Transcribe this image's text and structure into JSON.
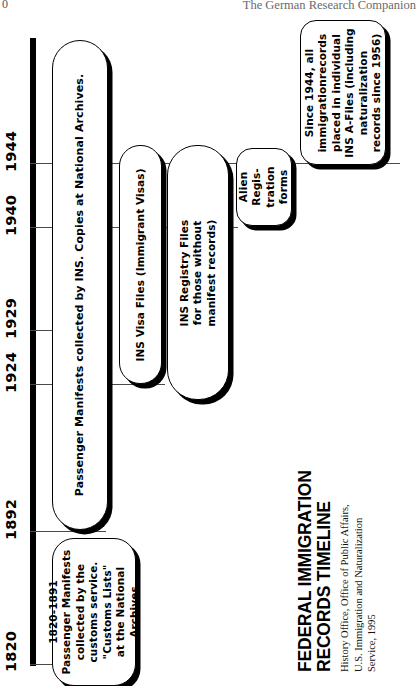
{
  "page": {
    "folio": "0",
    "running_head": "The German Research Companion"
  },
  "title_block": {
    "line1": "FEDERAL IMMIGRATION",
    "line2": "RECORDS TIMELINE",
    "credit_line1": "History Office, Office of  Public Affairs,",
    "credit_line2": "U.S. Immigration and Naturalization",
    "credit_line3": "Service, 1995"
  },
  "chart_data": {
    "type": "timeline",
    "title": "FEDERAL IMMIGRATION RECORDS TIMELINE",
    "axis_label": "",
    "axis_orientation": "vertical-bottom-to-top",
    "tick_labels": [
      "1820",
      "1892",
      "1924",
      "1929",
      "1940",
      "1944"
    ],
    "tick_values": [
      1820,
      1892,
      1924,
      1929,
      1940,
      1944
    ],
    "grid": true,
    "legend": "none",
    "bars": [
      {
        "id": "customs-lists",
        "label": "1820-1891\nPassenger Manifests\ncollected by the\ncustoms service.\n\"Customs Lists\"\nat the National\nArchives",
        "start": 1820,
        "end": 1891
      },
      {
        "id": "passenger-manifests",
        "label": "Passenger Manifests collected by INS.  Copies at National Archives.",
        "start": 1892,
        "end": 1944
      },
      {
        "id": "ins-visa-files",
        "label": "INS Visa Files (Immigrant Visas)",
        "start": 1924,
        "end": 1944
      },
      {
        "id": "ins-registry-files",
        "label": "INS Registry Files\nfor those without\nmanifest records)",
        "start": 1929,
        "end": 1944
      },
      {
        "id": "alien-registration-forms",
        "label": "Alien\nRegis-\ntration\nforms",
        "start": 1940,
        "end": 1944
      },
      {
        "id": "ins-a-files",
        "label": "Since 1944, all\nimmigrationrecords\nplaced in individual\nINS A-Files (including\nnaturalization\nrecords since 1956)",
        "start": 1944,
        "end": null
      }
    ]
  },
  "timeline": {
    "years": [
      {
        "label": "1820"
      },
      {
        "label": "1892"
      },
      {
        "label": "1924"
      },
      {
        "label": "1929"
      },
      {
        "label": "1940"
      },
      {
        "label": "1944"
      }
    ],
    "boxes": {
      "customs": "1820-1891\nPassenger Manifests\ncollected by the\ncustoms service.\n\"Customs Lists\"\nat the National\nArchives",
      "manifests": "Passenger Manifests collected by INS.  Copies at National Archives.",
      "visa": "INS Visa Files (Immigrant Visas)",
      "registry": "INS Registry Files\nfor those without\nmanifest records)",
      "alien": "Alien\nRegis-\ntration\nforms",
      "afiles": "Since 1944, all\nimmigrationrecords\nplaced in individual\nINS A-Files (including\nnaturalization\nrecords since 1956)"
    }
  },
  "colors": {
    "ink": "#000000",
    "paper": "#ffffff",
    "gridline": "#4a4a4a",
    "runhead": "#6a6a6a"
  }
}
